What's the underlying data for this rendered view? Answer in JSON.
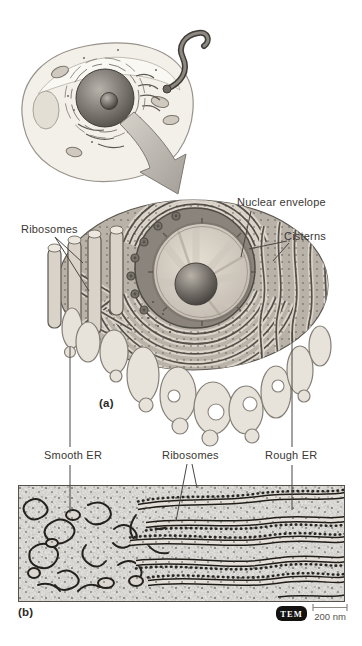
{
  "figure": {
    "labels": {
      "nuclear_envelope": "Nuclear envelope",
      "ribosomes_top": "Ribosomes",
      "cisterns": "Cisterns",
      "panel_a": "(a)",
      "smooth_er": "Smooth ER",
      "ribosomes_bottom": "Ribosomes",
      "rough_er": "Rough ER",
      "panel_b": "(b)",
      "tem_badge": "TEM",
      "scale_text": "200 nm"
    },
    "colors": {
      "background": "#ffffff",
      "label_text": "#3a3833",
      "leader_line": "#4a4641",
      "tem_badge_bg": "#141210",
      "tem_badge_text": "#ffffff",
      "scale_bar": "#8c8882",
      "diagram_membrane": "#55504a",
      "diagram_mass_fill": "#b8b2a9",
      "smooth_er_fill": "#e7e2da",
      "nucleolus_dark": "#3a3733"
    }
  }
}
